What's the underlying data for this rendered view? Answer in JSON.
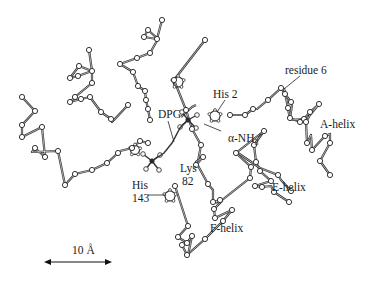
{
  "figure": {
    "stroke_color": "#333333",
    "node_fill": "#ffffff",
    "background": "#ffffff"
  },
  "labels": {
    "residue6": "residue 6",
    "his2": "His 2",
    "a_helix": "A-helix",
    "dpg": "DPG",
    "alpha_nh3": "α-NH",
    "alpha_nh3_sub": "3",
    "alpha_nh3_sup": "+",
    "lys82_line1": "Lys",
    "lys82_line2": "82",
    "his143_line1": "His",
    "his143_line2": "143",
    "e_helix": "E-helix",
    "f_helix": "F-helix",
    "scale": "10 Å"
  },
  "scale_bar": {
    "value": 10,
    "unit": "Å",
    "x1": 44,
    "x2": 112,
    "y": 262
  },
  "chains": [
    [
      [
        22,
        97
      ],
      [
        35,
        111
      ],
      [
        22,
        125
      ],
      [
        22,
        137
      ],
      [
        42,
        127
      ],
      [
        45,
        157
      ],
      [
        35,
        148
      ],
      [
        32,
        152
      ],
      [
        58,
        151
      ],
      [
        65,
        185
      ],
      [
        75,
        174
      ],
      [
        92,
        170
      ],
      [
        107,
        163
      ],
      [
        118,
        153
      ]
    ],
    [
      [
        89,
        50
      ],
      [
        92,
        71
      ],
      [
        78,
        76
      ],
      [
        70,
        78
      ],
      [
        79,
        66
      ],
      [
        92,
        71
      ],
      [
        92,
        83
      ],
      [
        75,
        97
      ],
      [
        70,
        102
      ],
      [
        81,
        99
      ],
      [
        90,
        97
      ],
      [
        101,
        112
      ],
      [
        111,
        119
      ],
      [
        112,
        122
      ],
      [
        128,
        105
      ]
    ],
    [
      [
        162,
        20
      ],
      [
        157,
        39
      ],
      [
        144,
        37
      ],
      [
        148,
        30
      ],
      [
        158,
        39
      ],
      [
        150,
        53
      ],
      [
        137,
        58
      ],
      [
        120,
        64
      ],
      [
        133,
        72
      ],
      [
        138,
        86
      ],
      [
        145,
        91
      ],
      [
        146,
        100
      ],
      [
        148,
        109
      ],
      [
        150,
        120
      ]
    ],
    [
      [
        205,
        40
      ],
      [
        174,
        80
      ],
      [
        186,
        110
      ],
      [
        192,
        129
      ],
      [
        201,
        145
      ],
      [
        197,
        167
      ]
    ],
    [
      [
        120,
        151
      ],
      [
        132,
        148
      ],
      [
        140,
        141
      ],
      [
        148,
        143
      ]
    ],
    [
      [
        181,
        117
      ],
      [
        192,
        107
      ],
      [
        196,
        105
      ]
    ],
    [
      [
        230,
        115
      ],
      [
        245,
        115
      ],
      [
        253,
        109
      ],
      [
        257,
        109
      ],
      [
        268,
        100
      ],
      [
        281,
        88
      ],
      [
        285,
        94
      ],
      [
        291,
        102
      ],
      [
        292,
        105
      ],
      [
        290,
        118
      ],
      [
        300,
        122
      ]
    ],
    [
      [
        284,
        88
      ],
      [
        288,
        108
      ],
      [
        290,
        120
      ],
      [
        304,
        119
      ],
      [
        310,
        112
      ],
      [
        319,
        104
      ],
      [
        310,
        115
      ],
      [
        306,
        122
      ],
      [
        307,
        143
      ],
      [
        311,
        135
      ],
      [
        312,
        150
      ],
      [
        325,
        136
      ],
      [
        330,
        134
      ],
      [
        330,
        143
      ],
      [
        320,
        161
      ],
      [
        330,
        175
      ]
    ],
    [
      [
        196,
        165
      ],
      [
        203,
        157
      ],
      [
        196,
        162
      ],
      [
        208,
        184
      ],
      [
        213,
        190
      ],
      [
        213,
        202
      ],
      [
        220,
        200
      ],
      [
        213,
        203
      ],
      [
        222,
        201
      ],
      [
        214,
        209
      ],
      [
        215,
        218
      ],
      [
        232,
        210
      ],
      [
        223,
        221
      ],
      [
        205,
        239
      ],
      [
        187,
        255
      ],
      [
        182,
        245
      ]
    ],
    [
      [
        217,
        204
      ],
      [
        250,
        178
      ],
      [
        251,
        167
      ],
      [
        236,
        153
      ],
      [
        264,
        131
      ],
      [
        254,
        145
      ],
      [
        256,
        162
      ],
      [
        260,
        171
      ],
      [
        271,
        181
      ],
      [
        255,
        186
      ],
      [
        262,
        187
      ],
      [
        271,
        186
      ],
      [
        274,
        192
      ],
      [
        289,
        202
      ]
    ],
    [
      [
        238,
        153
      ],
      [
        260,
        168
      ],
      [
        278,
        175
      ],
      [
        281,
        180
      ],
      [
        291,
        191
      ]
    ],
    [
      [
        175,
        186
      ],
      [
        188,
        226
      ],
      [
        178,
        237
      ],
      [
        187,
        243
      ],
      [
        192,
        236
      ],
      [
        188,
        255
      ]
    ]
  ],
  "nodes": [
    [
      22,
      97
    ],
    [
      35,
      111
    ],
    [
      22,
      125
    ],
    [
      22,
      137
    ],
    [
      42,
      127
    ],
    [
      45,
      157
    ],
    [
      35,
      148
    ],
    [
      58,
      151
    ],
    [
      65,
      185
    ],
    [
      75,
      174
    ],
    [
      92,
      170
    ],
    [
      107,
      163
    ],
    [
      118,
      153
    ],
    [
      89,
      50
    ],
    [
      92,
      71
    ],
    [
      78,
      76
    ],
    [
      70,
      78
    ],
    [
      79,
      66
    ],
    [
      92,
      83
    ],
    [
      75,
      97
    ],
    [
      70,
      102
    ],
    [
      81,
      99
    ],
    [
      90,
      97
    ],
    [
      101,
      112
    ],
    [
      111,
      119
    ],
    [
      128,
      105
    ],
    [
      162,
      20
    ],
    [
      157,
      39
    ],
    [
      144,
      37
    ],
    [
      148,
      30
    ],
    [
      150,
      53
    ],
    [
      137,
      58
    ],
    [
      120,
      64
    ],
    [
      133,
      72
    ],
    [
      138,
      86
    ],
    [
      145,
      91
    ],
    [
      146,
      100
    ],
    [
      148,
      109
    ],
    [
      150,
      120
    ],
    [
      205,
      40
    ],
    [
      174,
      80
    ],
    [
      186,
      110
    ],
    [
      192,
      129
    ],
    [
      201,
      145
    ],
    [
      132,
      148
    ],
    [
      140,
      141
    ],
    [
      148,
      143
    ],
    [
      230,
      115
    ],
    [
      245,
      115
    ],
    [
      253,
      109
    ],
    [
      268,
      100
    ],
    [
      281,
      88
    ],
    [
      285,
      94
    ],
    [
      291,
      102
    ],
    [
      290,
      118
    ],
    [
      300,
      122
    ],
    [
      288,
      108
    ],
    [
      304,
      119
    ],
    [
      310,
      112
    ],
    [
      319,
      104
    ],
    [
      306,
      122
    ],
    [
      307,
      143
    ],
    [
      312,
      150
    ],
    [
      325,
      136
    ],
    [
      330,
      143
    ],
    [
      320,
      161
    ],
    [
      330,
      175
    ],
    [
      196,
      165
    ],
    [
      203,
      157
    ],
    [
      208,
      184
    ],
    [
      213,
      202
    ],
    [
      220,
      200
    ],
    [
      214,
      209
    ],
    [
      215,
      218
    ],
    [
      232,
      210
    ],
    [
      223,
      221
    ],
    [
      205,
      239
    ],
    [
      187,
      255
    ],
    [
      182,
      245
    ],
    [
      250,
      178
    ],
    [
      251,
      167
    ],
    [
      236,
      153
    ],
    [
      264,
      131
    ],
    [
      254,
      145
    ],
    [
      256,
      162
    ],
    [
      260,
      171
    ],
    [
      271,
      181
    ],
    [
      255,
      186
    ],
    [
      262,
      187
    ],
    [
      274,
      192
    ],
    [
      289,
      202
    ],
    [
      278,
      175
    ],
    [
      291,
      191
    ],
    [
      175,
      186
    ],
    [
      188,
      226
    ],
    [
      178,
      237
    ],
    [
      187,
      243
    ],
    [
      192,
      236
    ]
  ],
  "rings": [
    {
      "name": "his2-ring",
      "cx": 215,
      "cy": 116,
      "r": 6
    },
    {
      "name": "his143-ring",
      "cx": 170,
      "cy": 196,
      "r": 6
    },
    {
      "name": "left-his-ring",
      "cx": 135,
      "cy": 150,
      "r": 5.5
    },
    {
      "name": "top-his-ring",
      "cx": 178,
      "cy": 82,
      "r": 6
    }
  ],
  "dpg_groups": [
    {
      "name": "dpg-phosphate-left",
      "cx": 152,
      "cy": 161,
      "arms": [
        [
          -9,
          -7
        ],
        [
          8,
          -6
        ],
        [
          -6,
          8
        ],
        [
          7,
          9
        ]
      ]
    },
    {
      "name": "dpg-phosphate-right",
      "cx": 188,
      "cy": 120,
      "arms": [
        [
          -6,
          -8
        ],
        [
          9,
          -5
        ],
        [
          -8,
          7
        ],
        [
          8,
          8
        ]
      ]
    }
  ],
  "pointers": [
    {
      "name": "residue6-pointer",
      "x1": 300,
      "y1": 76,
      "x2": 284,
      "y2": 89
    },
    {
      "name": "his2-pointer",
      "x1": 225,
      "y1": 100,
      "x2": 217,
      "y2": 112
    },
    {
      "name": "dpg-pointer",
      "x1": 168,
      "y1": 121,
      "x2": 174,
      "y2": 142
    },
    {
      "name": "alpha-nh3-pointer",
      "x1": 221,
      "y1": 131,
      "x2": 204,
      "y2": 124
    },
    {
      "name": "his143-pointer",
      "x1": 148,
      "y1": 195,
      "x2": 166,
      "y2": 195
    }
  ]
}
